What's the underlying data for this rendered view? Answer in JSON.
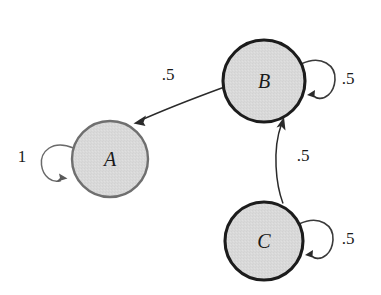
{
  "diagram": {
    "type": "state-transition-diagram",
    "background_color": "#ffffff",
    "node_fill_color": "#d9d9d9",
    "node_stroke_dark": "#1c1c1c",
    "node_stroke_light": "#6f6f6f",
    "edge_color": "#2a2a2a",
    "nodes": [
      {
        "id": "A",
        "label": "A",
        "cx": 110,
        "cy": 159,
        "r": 38,
        "stroke_style": "light"
      },
      {
        "id": "B",
        "label": "B",
        "cx": 264,
        "cy": 81,
        "r": 41,
        "stroke_style": "dark"
      },
      {
        "id": "C",
        "label": "C",
        "cx": 264,
        "cy": 241,
        "r": 39,
        "stroke_style": "dark"
      }
    ],
    "edges": [
      {
        "id": "A-A",
        "from": "A",
        "to": "A",
        "label": "1",
        "kind": "self-loop",
        "side": "left",
        "label_x": 22,
        "label_y": 162
      },
      {
        "id": "B-B",
        "from": "B",
        "to": "B",
        "label": ".5",
        "kind": "self-loop",
        "side": "right",
        "label_x": 348,
        "label_y": 84
      },
      {
        "id": "C-C",
        "from": "C",
        "to": "C",
        "label": ".5",
        "kind": "self-loop",
        "side": "right",
        "label_x": 348,
        "label_y": 244
      },
      {
        "id": "B-A",
        "from": "B",
        "to": "A",
        "label": ".5",
        "kind": "curve",
        "label_x": 168,
        "label_y": 80
      },
      {
        "id": "C-B",
        "from": "C",
        "to": "B",
        "label": ".5",
        "kind": "curve",
        "label_x": 303,
        "label_y": 161
      }
    ]
  }
}
